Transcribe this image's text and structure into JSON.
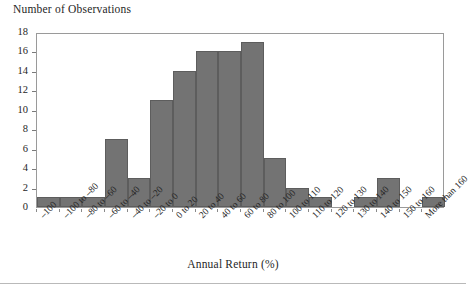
{
  "chart_data": {
    "type": "bar",
    "title": "",
    "ylabel": "Number of Observations",
    "xlabel": "Annual Return (%)",
    "categories": [
      "–100",
      "–100 to –80",
      "–80 to –60",
      "–60 to –40",
      "–40 to –20",
      "–20 to 0",
      "0 to 20",
      "20 to 40",
      "40 to 60",
      "60 to 80",
      "80 to 100",
      "100 to 110",
      "110 to 120",
      "120 to 130",
      "130 to 140",
      "140 to 150",
      "150 to 160",
      "More than 160"
    ],
    "values": [
      1,
      1,
      1,
      7,
      3,
      11,
      14,
      16,
      16,
      17,
      5,
      2,
      1,
      0,
      1,
      3,
      0,
      1
    ],
    "ylim": [
      0,
      18
    ],
    "yticks": [
      0,
      2,
      4,
      6,
      8,
      10,
      12,
      14,
      16,
      18
    ],
    "ytick_labels": [
      "0",
      "2",
      "4",
      "6",
      "8",
      "10",
      "12",
      "14",
      "16",
      "18"
    ],
    "grid": false,
    "legend": null,
    "bar_color": "#737373",
    "bar_edge_color": "#5d5d5d",
    "frame_color": "#9a9a9a"
  }
}
